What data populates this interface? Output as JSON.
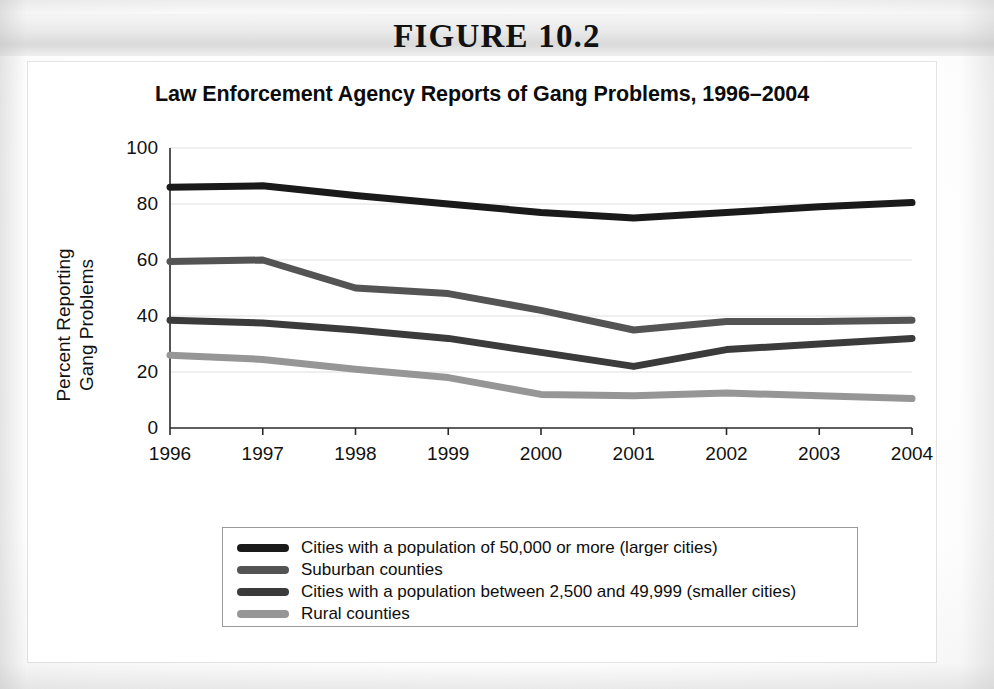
{
  "figure": {
    "number_label": "FIGURE 10.2"
  },
  "chart_data": {
    "type": "line",
    "title": "Law Enforcement Agency Reports of Gang Problems, 1996–2004",
    "xlabel": "Year",
    "ylabel_line1": "Percent Reporting",
    "ylabel_line2": "Gang Problems",
    "categories": [
      "1996",
      "1997",
      "1998",
      "1999",
      "2000",
      "2001",
      "2002",
      "2003",
      "2004"
    ],
    "x": [
      1996,
      1997,
      1998,
      1999,
      2000,
      2001,
      2002,
      2003,
      2004
    ],
    "xlim": [
      1996,
      2004
    ],
    "ylim": [
      0,
      100
    ],
    "yticks": [
      0,
      20,
      40,
      60,
      80,
      100
    ],
    "grid": true,
    "legend_position": "below",
    "series": [
      {
        "name": "Cities with a population of 50,000 or more (larger cities)",
        "color": "#1a1a1a",
        "values": [
          86,
          86.5,
          83,
          80,
          77,
          75,
          77,
          79,
          80.5
        ]
      },
      {
        "name": "Suburban counties",
        "color": "#545454",
        "values": [
          59.5,
          60,
          50,
          48,
          42,
          35,
          38,
          38,
          38.5
        ]
      },
      {
        "name": "Cities with a population between 2,500 and 49,999 (smaller cities)",
        "color": "#3b3b3b",
        "values": [
          38.5,
          37.5,
          35,
          32,
          27,
          22,
          28,
          30,
          32
        ]
      },
      {
        "name": "Rural counties",
        "color": "#969696",
        "values": [
          26,
          24.5,
          21,
          18,
          12,
          11.5,
          12.5,
          11.5,
          10.5
        ]
      }
    ]
  },
  "legend": {
    "items": [
      {
        "label": "Cities with a population of 50,000 or more (larger cities)",
        "color": "#1a1a1a"
      },
      {
        "label": "Suburban counties",
        "color": "#545454"
      },
      {
        "label": "Cities with a population between 2,500 and 49,999 (smaller cities)",
        "color": "#3b3b3b"
      },
      {
        "label": "Rural counties",
        "color": "#969696"
      }
    ]
  }
}
